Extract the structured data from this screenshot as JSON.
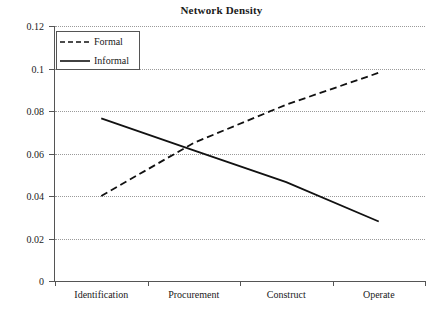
{
  "chart_data": {
    "type": "line",
    "title": "Network Density",
    "xlabel": "",
    "ylabel": "",
    "categories": [
      "Identification",
      "Procurement",
      "Construct",
      "Operate"
    ],
    "series": [
      {
        "name": "Formal",
        "style": "dashed",
        "color": "#111111",
        "values": [
          0.04,
          0.065,
          0.083,
          0.098
        ]
      },
      {
        "name": "Informal",
        "style": "solid",
        "color": "#111111",
        "values": [
          0.0765,
          0.0615,
          0.0465,
          0.028
        ]
      }
    ],
    "ylim": [
      0,
      0.12
    ],
    "yticks": [
      0,
      0.02,
      0.04,
      0.06,
      0.08,
      0.1,
      0.12
    ],
    "ytick_labels": [
      "0",
      "0.02",
      "0.04",
      "0.06",
      "0.08",
      "0.1",
      "0.12"
    ],
    "grid": true,
    "grid_axis": "y",
    "legend_position": "top-left"
  },
  "legend": {
    "entries": [
      {
        "label": "Formal"
      },
      {
        "label": "Informal"
      }
    ]
  }
}
